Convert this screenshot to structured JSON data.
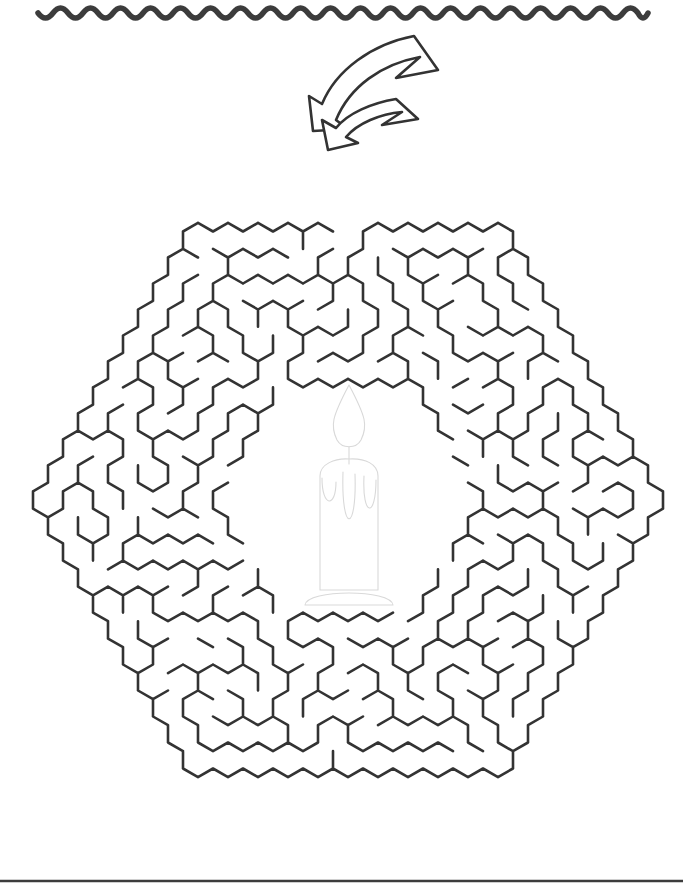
{
  "page": {
    "width": 683,
    "height": 894,
    "background_color": "#ffffff"
  },
  "decorations": {
    "top_wave": {
      "name": "wavy-divider",
      "color": "#3c3c3c",
      "x_start": 38,
      "x_end": 648,
      "y": 13,
      "amplitude": 5,
      "period": 30,
      "stroke_width": 5.5
    },
    "bottom_rule": {
      "name": "horizontal-rule",
      "color": "#3c3c3c",
      "x_start": 0,
      "x_end": 683,
      "y": 881,
      "stroke_width": 2.4
    }
  },
  "arrow": {
    "name": "entrance-arrow",
    "description": "hand-drawn curved outline arrow pointing down-left into the maze entrance",
    "outline_color": "#333333",
    "fill_color": "#ffffff",
    "tip_x": 330,
    "tip_y": 128,
    "tail_x": 414,
    "tail_y": 36
  },
  "maze": {
    "name": "hexagonal-honeycomb-maze",
    "type": "hexagonal",
    "wall_color": "#333333",
    "wall_width": 2.6,
    "center_x": 348,
    "center_y": 500,
    "outer_radius": 360,
    "inner_void_radius": 115,
    "cell_width": 30,
    "cell_height": 35,
    "entrance": {
      "x": 348,
      "y": 152,
      "position": "top-apex"
    },
    "goal": {
      "x": 348,
      "y": 490,
      "position": "center-chamber"
    },
    "rings": 10
  },
  "candle": {
    "name": "candle-illustration",
    "line_color": "#d9d9d9",
    "center_x": 349,
    "flame_top_y": 385,
    "wick_y": 456,
    "body_top_y": 462,
    "body_bottom_y": 590,
    "base_y": 605,
    "body_left_x": 318,
    "body_right_x": 380,
    "drip_count": 3
  }
}
